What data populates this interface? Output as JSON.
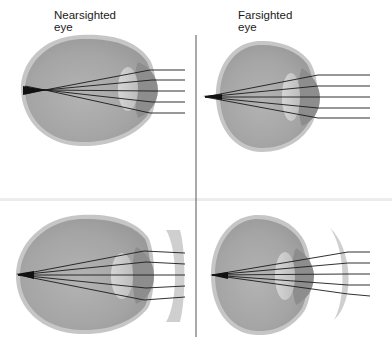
{
  "diagram": {
    "panels": [
      {
        "id": "nearsighted-uncorrected",
        "label": "Nearsighted\neye",
        "corrective_lens": "none",
        "focus_position": "in front of retina"
      },
      {
        "id": "farsighted-uncorrected",
        "label": "Farsighted\neye",
        "corrective_lens": "none",
        "focus_position": "behind retina"
      },
      {
        "id": "nearsighted-corrected",
        "label": "",
        "corrective_lens": "concave",
        "focus_position": "on retina"
      },
      {
        "id": "farsighted-corrected",
        "label": "",
        "corrective_lens": "convex",
        "focus_position": "on retina"
      }
    ],
    "colors": {
      "background": "#ffffff",
      "sclera_rim": "#c4c4c4",
      "eye_body": "#a9a9a9",
      "iris_cornea_dark": "#8a8a8a",
      "lens": "#c9c9c9",
      "corrective_lens": "#cfcfcf",
      "ray": "#1a1a1a",
      "divider": "#555555",
      "separator_band": "#e6e6e6"
    }
  },
  "labels": {
    "nearsighted": "Nearsighted\neye",
    "farsighted": "Farsighted\neye"
  }
}
